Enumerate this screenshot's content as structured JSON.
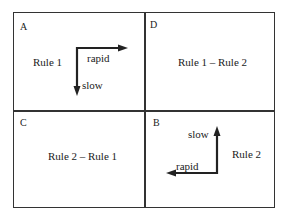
{
  "quadrants": {
    "A": {
      "letter": "A",
      "label": "Rule 1",
      "arrow_right": "rapid",
      "arrow_down": "slow"
    },
    "D": {
      "letter": "D",
      "label": "Rule 1 – Rule 2"
    },
    "C": {
      "letter": "C",
      "label": "Rule 2 – Rule 1"
    },
    "B": {
      "letter": "B",
      "label": "Rule 2",
      "arrow_left": "rapid",
      "arrow_up": "slow"
    }
  }
}
